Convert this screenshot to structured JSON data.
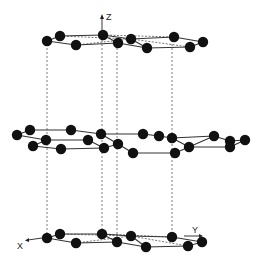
{
  "diagram": {
    "title": "",
    "colors": {
      "atom": "#111111",
      "bond": "#333333",
      "background": "#ffffff"
    },
    "axes": {
      "z_label": "Z",
      "x_label": "X",
      "y_label": "Y"
    },
    "layers": [
      {
        "name": "top",
        "atoms": [
          [
            47,
            41
          ],
          [
            60,
            36
          ],
          [
            76,
            45
          ],
          [
            103,
            35
          ],
          [
            118,
            43
          ],
          [
            131,
            39
          ],
          [
            147,
            48
          ],
          [
            174,
            37
          ],
          [
            190,
            47
          ],
          [
            203,
            42
          ]
        ],
        "bonds": [
          [
            0,
            1
          ],
          [
            1,
            3
          ],
          [
            0,
            2
          ],
          [
            2,
            4
          ],
          [
            3,
            4
          ],
          [
            4,
            6
          ],
          [
            3,
            5
          ],
          [
            5,
            7
          ],
          [
            6,
            8
          ],
          [
            7,
            9
          ],
          [
            8,
            9
          ],
          [
            5,
            6
          ]
        ],
        "dashed_bonds": [
          [
            1,
            5
          ],
          [
            2,
            5
          ],
          [
            3,
            7
          ],
          [
            5,
            8
          ]
        ]
      },
      {
        "name": "middle",
        "atoms": [
          [
            17,
            135
          ],
          [
            30,
            130
          ],
          [
            46,
            140
          ],
          [
            33,
            146
          ],
          [
            61,
            149
          ],
          [
            71,
            130
          ],
          [
            88,
            140
          ],
          [
            101,
            134
          ],
          [
            104,
            148
          ],
          [
            118,
            144
          ],
          [
            133,
            153
          ],
          [
            143,
            134
          ],
          [
            159,
            136
          ],
          [
            172,
            138
          ],
          [
            175,
            153
          ],
          [
            189,
            147
          ],
          [
            214,
            136
          ],
          [
            230,
            141
          ],
          [
            245,
            140
          ],
          [
            230,
            147
          ]
        ],
        "bonds": [
          [
            0,
            1
          ],
          [
            0,
            2
          ],
          [
            1,
            5
          ],
          [
            5,
            7
          ],
          [
            2,
            6
          ],
          [
            6,
            8
          ],
          [
            3,
            4
          ],
          [
            4,
            8
          ],
          [
            3,
            2
          ],
          [
            7,
            9
          ],
          [
            9,
            10
          ],
          [
            8,
            9
          ],
          [
            7,
            11
          ],
          [
            11,
            12
          ],
          [
            12,
            13
          ],
          [
            13,
            15
          ],
          [
            10,
            14
          ],
          [
            14,
            15
          ],
          [
            15,
            16
          ],
          [
            16,
            17
          ],
          [
            17,
            18
          ],
          [
            13,
            16
          ],
          [
            15,
            19
          ],
          [
            19,
            18
          ]
        ],
        "dashed_bonds": []
      },
      {
        "name": "bottom",
        "atoms": [
          [
            47,
            238
          ],
          [
            60,
            234
          ],
          [
            76,
            243
          ],
          [
            102,
            234
          ],
          [
            117,
            242
          ],
          [
            131,
            236
          ],
          [
            146,
            247
          ],
          [
            172,
            237
          ],
          [
            188,
            246
          ],
          [
            202,
            242
          ]
        ],
        "bonds": [
          [
            0,
            1
          ],
          [
            1,
            3
          ],
          [
            0,
            2
          ],
          [
            2,
            4
          ],
          [
            3,
            4
          ],
          [
            4,
            6
          ],
          [
            3,
            5
          ],
          [
            5,
            7
          ],
          [
            6,
            8
          ],
          [
            7,
            9
          ],
          [
            8,
            9
          ],
          [
            5,
            6
          ]
        ],
        "dashed_bonds": [
          [
            1,
            5
          ],
          [
            2,
            5
          ],
          [
            3,
            7
          ],
          [
            5,
            8
          ]
        ]
      }
    ],
    "projection_lines_x": [
      47,
      102,
      117,
      172
    ]
  }
}
